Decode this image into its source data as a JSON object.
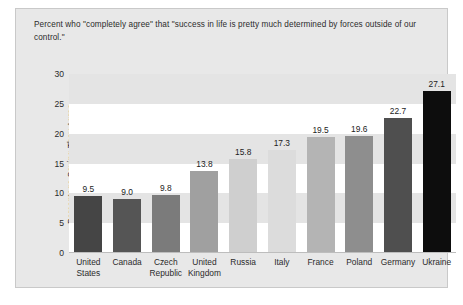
{
  "panel": {
    "title": "Percent who \"completely agree\" that \"success in life is pretty much determined by forces outside of our control.\""
  },
  "chart_data": {
    "type": "bar",
    "title": "Percent who \"completely agree\" that \"success in life is pretty much determined by forces outside of our control.\"",
    "xlabel": "",
    "ylabel": "Percentage Saying They Agree",
    "ylim": [
      0,
      30
    ],
    "yticks": [
      "0",
      "5",
      "10",
      "15",
      "20",
      "25",
      "30"
    ],
    "grid": false,
    "legend": "none",
    "categories": [
      "United States",
      "Canada",
      "Czech Republic",
      "United Kingdom",
      "Russia",
      "Italy",
      "France",
      "Poland",
      "Germany",
      "Ukraine"
    ],
    "category_lines": [
      [
        "United",
        "States"
      ],
      [
        "Canada",
        ""
      ],
      [
        "Czech",
        "Republic"
      ],
      [
        "United",
        "Kingdom"
      ],
      [
        "Russia",
        ""
      ],
      [
        "Italy",
        ""
      ],
      [
        "France",
        ""
      ],
      [
        "Poland",
        ""
      ],
      [
        "Germany",
        ""
      ],
      [
        "Ukraine",
        ""
      ]
    ],
    "values": [
      9.5,
      9.0,
      9.8,
      13.8,
      15.8,
      17.3,
      19.5,
      19.6,
      22.7,
      27.1
    ],
    "value_labels": [
      "9.5",
      "9.0",
      "9.8",
      "13.8",
      "15.8",
      "17.3",
      "19.5",
      "19.6",
      "22.7",
      "27.1"
    ],
    "bar_colors": [
      "#454545",
      "#555555",
      "#7b7b7b",
      "#a0a0a0",
      "#cfcfcf",
      "#dcdcdc",
      "#b4b4b4",
      "#8e8e8e",
      "#4f4f4f",
      "#0d0d0d"
    ]
  },
  "colors": {
    "panel_background": "#e8e8e8",
    "band_light": "#ffffff",
    "band_gray": "#e4e4e4",
    "text": "#2b2b2b"
  }
}
